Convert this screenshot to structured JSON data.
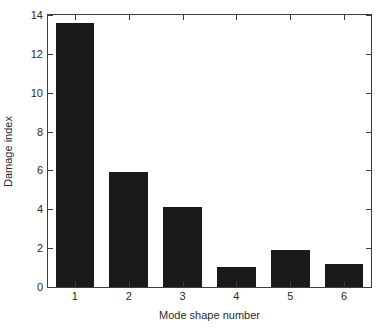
{
  "chart_data": {
    "type": "bar",
    "title": "",
    "xlabel": "Mode shape number",
    "ylabel": "Damage index",
    "categories": [
      "1",
      "2",
      "3",
      "4",
      "5",
      "6"
    ],
    "values": [
      13.6,
      5.93,
      4.14,
      1.02,
      1.89,
      1.18
    ],
    "series": [
      {
        "name": "Damage index",
        "values": [
          13.6,
          5.93,
          4.14,
          1.02,
          1.89,
          1.18
        ]
      }
    ],
    "ylim": [
      0,
      14
    ],
    "xlim": [
      0.5,
      6.5
    ],
    "yticks": [
      0,
      2,
      4,
      6,
      8,
      10,
      12,
      14
    ],
    "ytick_labels": [
      "0",
      "2",
      "4",
      "6",
      "8",
      "10",
      "12",
      "14"
    ],
    "xticks": [
      1,
      2,
      3,
      4,
      5,
      6
    ],
    "xtick_labels": [
      "1",
      "2",
      "3",
      "4",
      "5",
      "6"
    ],
    "grid": false,
    "legend": false,
    "legend_position": "none",
    "bar_color": "#1a1a1a",
    "axis_color": "#3d3d3d",
    "background_color": "#ffffff",
    "bar_width_fraction": 0.72
  }
}
